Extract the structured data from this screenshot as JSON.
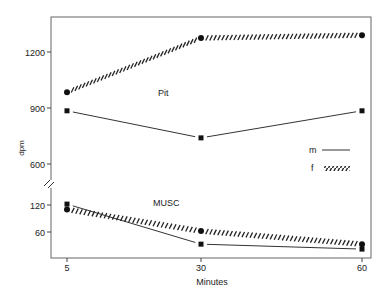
{
  "chart_data": {
    "type": "line",
    "title": "",
    "xlabel": "Minutes",
    "ylabel": "dpm",
    "x": [
      5,
      30,
      60
    ],
    "x_tick_labels": [
      "5",
      "30",
      "60"
    ],
    "y_axis_broken": true,
    "y_upper_ticks": [
      600,
      900,
      1200
    ],
    "y_lower_ticks": [
      60,
      120
    ],
    "y_tick_labels": [
      "1200",
      "900",
      "600",
      "120",
      "60"
    ],
    "grid": false,
    "legend": {
      "position": "right-middle",
      "entries": [
        {
          "label": "m",
          "style": "solid"
        },
        {
          "label": "f",
          "style": "hatched"
        }
      ]
    },
    "annotations": [
      "Pit",
      "MUSC"
    ],
    "series": [
      {
        "name": "Pit f",
        "group": "Pit",
        "sex": "f",
        "marker": "circle",
        "style": "hatched",
        "values": [
          985,
          1275,
          1290
        ]
      },
      {
        "name": "Pit m",
        "group": "Pit",
        "sex": "m",
        "marker": "square",
        "style": "solid",
        "values": [
          885,
          740,
          885
        ]
      },
      {
        "name": "MUSC m",
        "group": "MUSC",
        "sex": "m",
        "marker": "square",
        "style": "solid",
        "values": [
          122,
          33,
          22
        ]
      },
      {
        "name": "MUSC f",
        "group": "MUSC",
        "sex": "f",
        "marker": "circle",
        "style": "hatched",
        "values": [
          110,
          62,
          33
        ]
      }
    ]
  }
}
